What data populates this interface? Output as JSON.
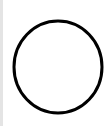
{
  "canvas": {
    "background": "#ffffff",
    "left_border_color": "#e4e4e4"
  },
  "shape": {
    "type": "circle",
    "icon": "circle-outline-icon",
    "stroke_color": "#000000",
    "fill_color": "#ffffff",
    "cx": 58,
    "cy": 67,
    "rx": 44,
    "ry": 46,
    "stroke_width": 3
  }
}
